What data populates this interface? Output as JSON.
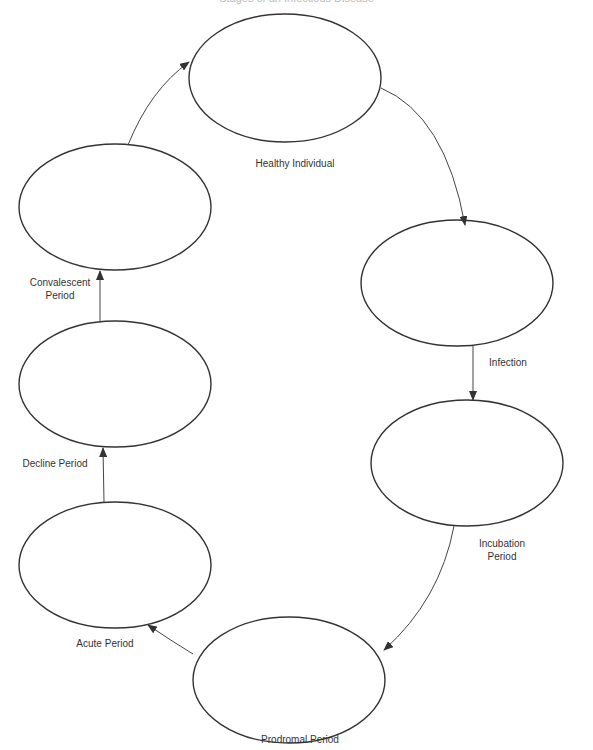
{
  "title": "Stages of an Infectious Disease",
  "colors": {
    "stroke": "#333333",
    "background": "#ffffff",
    "text": "#333333"
  },
  "stages": [
    {
      "id": "healthy",
      "label": "Healthy Individual"
    },
    {
      "id": "infection",
      "label": "Infection"
    },
    {
      "id": "incubation",
      "label": "Incubation Period"
    },
    {
      "id": "prodromal",
      "label": "Prodromal Period"
    },
    {
      "id": "acute",
      "label": "Acute Period"
    },
    {
      "id": "decline",
      "label": "Decline Period"
    },
    {
      "id": "convalescent",
      "label": "Convalescent Period"
    }
  ],
  "labels": {
    "healthy": "Healthy Individual",
    "infection": "Infection",
    "incubation_1": "Incubation",
    "incubation_2": "Period",
    "prodromal": "Prodromal Period",
    "acute": "Acute Period",
    "decline": "Decline Period",
    "convalescent_1": "Convalescent",
    "convalescent_2": "Period"
  }
}
